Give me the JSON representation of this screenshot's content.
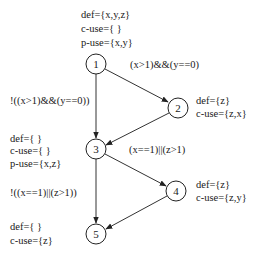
{
  "diagram": {
    "type": "control-flow-graph",
    "colors": {
      "stroke": "#222222",
      "text": "#1a1a1a",
      "background": "#ffffff"
    },
    "nodes": [
      {
        "id": "1",
        "label": "1",
        "cx": 96,
        "cy": 64,
        "annotations": [
          "def={x,y,z}",
          "c-use={ }",
          "p-use={x,y}"
        ]
      },
      {
        "id": "2",
        "label": "2",
        "cx": 178,
        "cy": 108,
        "annotations": [
          "def={z}",
          "c-use={z,x}"
        ]
      },
      {
        "id": "3",
        "label": "3",
        "cx": 96,
        "cy": 149,
        "annotations": [
          "def={ }",
          "c-use={ }",
          "p-use={x,z}"
        ]
      },
      {
        "id": "4",
        "label": "4",
        "cx": 176,
        "cy": 191,
        "annotations": [
          "def={z}",
          "c-use={z,y}"
        ]
      },
      {
        "id": "5",
        "label": "5",
        "cx": 96,
        "cy": 234,
        "annotations": [
          "def={ }",
          "c-use={z}"
        ]
      }
    ],
    "edges": [
      {
        "from": "1",
        "to": "2",
        "label": "(x>1)&&(y==0)"
      },
      {
        "from": "1",
        "to": "3",
        "label": "!((x>1)&&(y==0))"
      },
      {
        "from": "2",
        "to": "3",
        "label": ""
      },
      {
        "from": "3",
        "to": "4",
        "label": "(x==1)||(z>1)"
      },
      {
        "from": "3",
        "to": "5",
        "label": "!((x==1)||(z>1))"
      },
      {
        "from": "4",
        "to": "5",
        "label": ""
      }
    ]
  }
}
